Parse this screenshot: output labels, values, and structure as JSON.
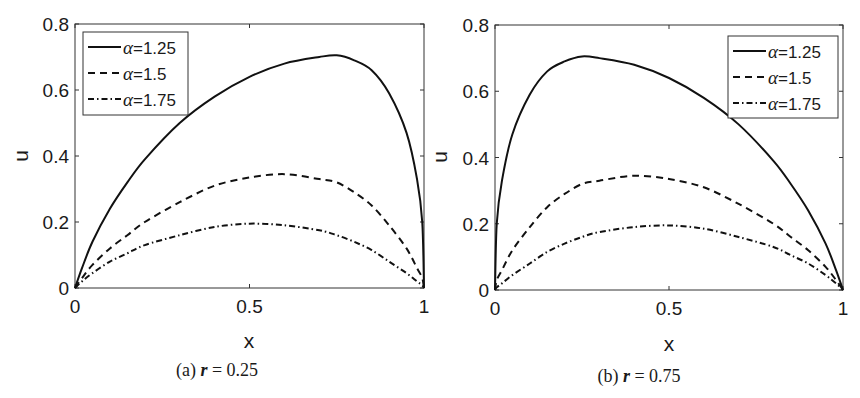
{
  "figure": {
    "panels": [
      {
        "id": "a",
        "caption_prefix": "(a) ",
        "caption_var": "r",
        "caption_suffix": " = 0.25",
        "xlabel": "x",
        "ylabel": "u",
        "xticks": [
          "0",
          "0.5",
          "1"
        ],
        "yticks": [
          "0",
          "0.2",
          "0.4",
          "0.6",
          "0.8"
        ],
        "legend_position": "upper-left"
      },
      {
        "id": "b",
        "caption_prefix": "(b) ",
        "caption_var": "r",
        "caption_suffix": " = 0.75",
        "xlabel": "x",
        "ylabel": "u",
        "xticks": [
          "0",
          "0.5",
          "1"
        ],
        "yticks": [
          "0",
          "0.2",
          "0.4",
          "0.6",
          "0.8"
        ],
        "legend_position": "upper-right"
      }
    ],
    "legend": [
      {
        "symbol": "α",
        "label": "=1.25",
        "style": "solid"
      },
      {
        "symbol": "α",
        "label": "=1.5",
        "style": "dashed"
      },
      {
        "symbol": "α",
        "label": "=1.75",
        "style": "dashdot"
      }
    ],
    "colors": {
      "line": "#111111",
      "axis": "#333333",
      "background": "#ffffff"
    }
  },
  "chart_data": [
    {
      "type": "line",
      "title": "(a) r = 0.25",
      "xlabel": "x",
      "ylabel": "u",
      "xlim": [
        0,
        1
      ],
      "ylim": [
        0,
        0.8
      ],
      "grid": false,
      "legend_position": "upper-left",
      "x": [
        0,
        0.02,
        0.05,
        0.1,
        0.15,
        0.2,
        0.3,
        0.4,
        0.5,
        0.6,
        0.7,
        0.75,
        0.8,
        0.85,
        0.9,
        0.95,
        0.98,
        0.995,
        1
      ],
      "series": [
        {
          "name": "α=1.25",
          "style": "solid",
          "values": [
            0,
            0.06,
            0.14,
            0.24,
            0.32,
            0.39,
            0.5,
            0.58,
            0.64,
            0.68,
            0.7,
            0.705,
            0.69,
            0.66,
            0.59,
            0.47,
            0.33,
            0.2,
            0
          ]
        },
        {
          "name": "α=1.5",
          "style": "dashed",
          "values": [
            0,
            0.03,
            0.07,
            0.12,
            0.16,
            0.2,
            0.26,
            0.31,
            0.335,
            0.345,
            0.33,
            0.32,
            0.29,
            0.25,
            0.19,
            0.12,
            0.06,
            0.03,
            0
          ]
        },
        {
          "name": "α=1.75",
          "style": "dashdot",
          "values": [
            0,
            0.02,
            0.045,
            0.08,
            0.105,
            0.13,
            0.16,
            0.185,
            0.195,
            0.19,
            0.175,
            0.16,
            0.14,
            0.115,
            0.08,
            0.045,
            0.02,
            0.008,
            0
          ]
        }
      ]
    },
    {
      "type": "line",
      "title": "(b) r = 0.75",
      "xlabel": "x",
      "ylabel": "u",
      "xlim": [
        0,
        1
      ],
      "ylim": [
        0,
        0.8
      ],
      "grid": false,
      "legend_position": "upper-right",
      "x": [
        0,
        0.005,
        0.02,
        0.05,
        0.1,
        0.15,
        0.2,
        0.25,
        0.3,
        0.4,
        0.5,
        0.6,
        0.7,
        0.8,
        0.85,
        0.9,
        0.95,
        0.98,
        1
      ],
      "series": [
        {
          "name": "α=1.25",
          "style": "solid",
          "values": [
            0,
            0.2,
            0.33,
            0.47,
            0.59,
            0.66,
            0.69,
            0.705,
            0.7,
            0.68,
            0.64,
            0.58,
            0.5,
            0.39,
            0.32,
            0.24,
            0.14,
            0.06,
            0
          ]
        },
        {
          "name": "α=1.5",
          "style": "dashed",
          "values": [
            0,
            0.03,
            0.06,
            0.12,
            0.19,
            0.25,
            0.29,
            0.32,
            0.33,
            0.345,
            0.335,
            0.31,
            0.26,
            0.2,
            0.16,
            0.12,
            0.07,
            0.03,
            0
          ]
        },
        {
          "name": "α=1.75",
          "style": "dashdot",
          "values": [
            0,
            0.008,
            0.02,
            0.045,
            0.08,
            0.115,
            0.14,
            0.16,
            0.175,
            0.19,
            0.195,
            0.185,
            0.16,
            0.13,
            0.105,
            0.08,
            0.045,
            0.02,
            0
          ]
        }
      ]
    }
  ]
}
